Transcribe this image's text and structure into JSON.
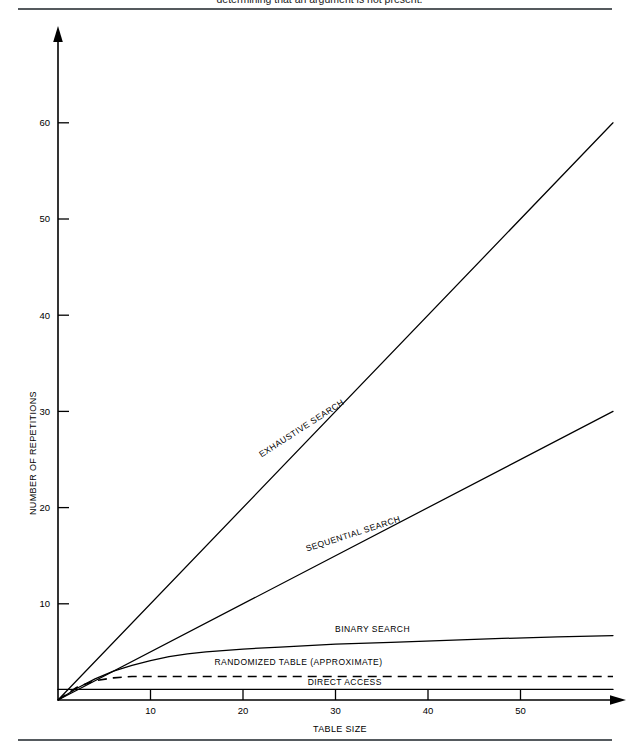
{
  "caption": {
    "text": "determining that an argument is not present."
  },
  "chart_data": {
    "type": "line",
    "title": "",
    "xlabel": "TABLE SIZE",
    "ylabel": "NUMBER OF REPETITIONS",
    "xlim": [
      0,
      60
    ],
    "ylim": [
      0,
      65
    ],
    "xticks": [
      10,
      20,
      30,
      40,
      50
    ],
    "yticks": [
      10,
      20,
      30,
      40,
      50,
      60
    ],
    "grid": false,
    "legend_position": "inline-labels",
    "series": [
      {
        "name": "EXHAUSTIVE SEARCH",
        "style": "solid",
        "label_anchor": {
          "x": 26.5,
          "y": 28.0
        },
        "x": [
          0,
          60
        ],
        "y": [
          0,
          60
        ]
      },
      {
        "name": "SEQUENTIAL SEARCH",
        "style": "solid",
        "label_anchor": {
          "x": 32.0,
          "y": 17.0
        },
        "x": [
          0,
          60
        ],
        "y": [
          0,
          30
        ]
      },
      {
        "name": "BINARY SEARCH",
        "style": "solid",
        "label_anchor": {
          "x": 34.0,
          "y": 7.1
        },
        "x": [
          0,
          2,
          4,
          6,
          8,
          10,
          12,
          14,
          16,
          20,
          24,
          30,
          36,
          42,
          48,
          54,
          60
        ],
        "y": [
          0,
          1.2,
          2.2,
          3.0,
          3.6,
          4.1,
          4.5,
          4.8,
          5.0,
          5.3,
          5.5,
          5.8,
          6.0,
          6.2,
          6.4,
          6.55,
          6.7
        ]
      },
      {
        "name": "RANDOMIZED  TABLE (APPROXIMATE)",
        "style": "dashed",
        "label_anchor": {
          "x": 26.0,
          "y": 3.6
        },
        "x": [
          0,
          2,
          4,
          6,
          8,
          60
        ],
        "y": [
          0,
          1.3,
          2.0,
          2.3,
          2.45,
          2.45
        ]
      },
      {
        "name": "DIRECT ACCESS",
        "style": "solid",
        "label_anchor": {
          "x": 31.0,
          "y": 1.55
        },
        "x": [
          0,
          60
        ],
        "y": [
          1.1,
          1.1
        ]
      }
    ]
  }
}
